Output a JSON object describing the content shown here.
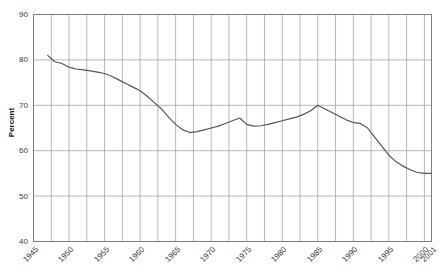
{
  "chart_data": {
    "type": "line",
    "title": "",
    "xlabel": "",
    "ylabel": "Percent",
    "xlim": [
      1945,
      2001
    ],
    "ylim": [
      40,
      90
    ],
    "ytick_step": 10,
    "grid": true,
    "legend": false,
    "line_color": "#555555",
    "axis_color": "#808080",
    "grid_color": "#9a9a9a",
    "y_ticks": [
      90,
      80,
      70,
      60,
      50,
      40
    ],
    "x_ticks": [
      1945,
      1950,
      1955,
      1960,
      1965,
      1970,
      1975,
      1980,
      1985,
      1990,
      1995,
      2000,
      2001
    ],
    "x": [
      1947,
      1948,
      1949,
      1950,
      1951,
      1952,
      1953,
      1954,
      1955,
      1956,
      1957,
      1958,
      1959,
      1960,
      1961,
      1962,
      1963,
      1964,
      1965,
      1966,
      1967,
      1968,
      1969,
      1970,
      1971,
      1972,
      1973,
      1974,
      1975,
      1976,
      1977,
      1978,
      1979,
      1980,
      1981,
      1982,
      1983,
      1984,
      1985,
      1986,
      1987,
      1988,
      1989,
      1990,
      1991,
      1992,
      1993,
      1994,
      1995,
      1996,
      1997,
      1998,
      1999,
      2000,
      2001
    ],
    "values": [
      81.0,
      79.6,
      79.2,
      78.4,
      78.0,
      77.8,
      77.6,
      77.3,
      77.0,
      76.4,
      75.6,
      74.8,
      74.0,
      73.2,
      72.0,
      70.6,
      69.2,
      67.4,
      65.8,
      64.6,
      64.0,
      64.2,
      64.6,
      65.0,
      65.4,
      66.0,
      66.6,
      67.2,
      65.8,
      65.4,
      65.5,
      65.8,
      66.2,
      66.6,
      67.0,
      67.4,
      68.0,
      68.8,
      70.0,
      69.2,
      68.4,
      67.6,
      66.8,
      66.2,
      66.0,
      65.0,
      63.0,
      61.0,
      59.0,
      57.6,
      56.6,
      55.8,
      55.2,
      55.0,
      55.0
    ]
  },
  "axis": {
    "y_label_text": "Percent"
  }
}
